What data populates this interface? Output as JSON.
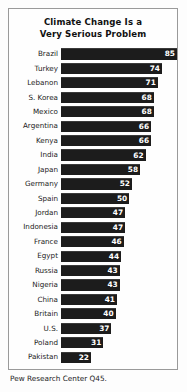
{
  "chart_data": {
    "type": "bar",
    "orientation": "horizontal",
    "title": "Climate Change Is a Very Serious Problem",
    "title_lines": [
      "Climate Change Is a",
      "Very Serious Problem"
    ],
    "xlabel": "",
    "ylabel": "",
    "xlim": [
      0,
      85
    ],
    "grid": false,
    "legend": false,
    "value_labels_inside": true,
    "source": "Pew Research Center Q45.",
    "bar_color": "#1c1c1c",
    "value_label_color": "#ffffff",
    "categories": [
      "Brazil",
      "Turkey",
      "Lebanon",
      "S. Korea",
      "Mexico",
      "Argentina",
      "Kenya",
      "India",
      "Japan",
      "Germany",
      "Spain",
      "Jordan",
      "Indonesia",
      "France",
      "Egypt",
      "Russia",
      "Nigeria",
      "China",
      "Britain",
      "U.S.",
      "Poland",
      "Pakistan"
    ],
    "values": [
      85,
      74,
      71,
      68,
      68,
      66,
      66,
      62,
      58,
      52,
      50,
      47,
      47,
      46,
      44,
      43,
      43,
      41,
      40,
      37,
      31,
      22
    ]
  }
}
